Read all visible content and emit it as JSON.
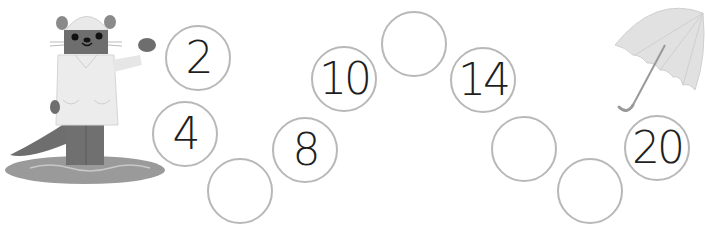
{
  "puzzle": {
    "sequence": [
      {
        "value": "2",
        "cx": 198,
        "cy": 58
      },
      {
        "value": "4",
        "cx": 185,
        "cy": 134
      },
      {
        "value": "",
        "cx": 240,
        "cy": 191
      },
      {
        "value": "8",
        "cx": 305,
        "cy": 150
      },
      {
        "value": "10",
        "cx": 344,
        "cy": 79
      },
      {
        "value": "",
        "cx": 414,
        "cy": 44
      },
      {
        "value": "14",
        "cx": 483,
        "cy": 80
      },
      {
        "value": "",
        "cx": 524,
        "cy": 149
      },
      {
        "value": "",
        "cx": 590,
        "cy": 191
      },
      {
        "value": "20",
        "cx": 657,
        "cy": 148
      }
    ]
  },
  "illustrations": {
    "character": "otter-in-raincoat-icon",
    "prop": "umbrella-icon",
    "ground": "puddle-icon"
  }
}
